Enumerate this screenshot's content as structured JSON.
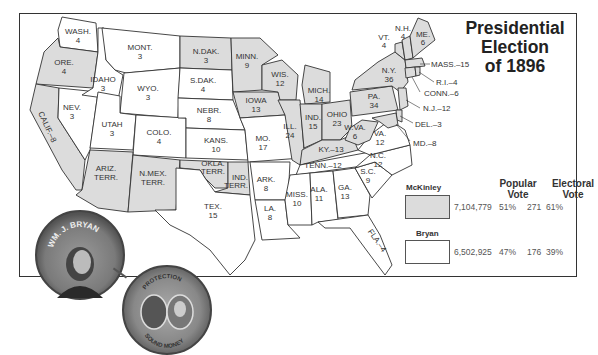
{
  "title": {
    "line1": "Presidential",
    "line2": "Election",
    "line3": "of 1896"
  },
  "colors": {
    "mckinley": "#dcdcdc",
    "bryan": "#ffffff",
    "border": "#333333"
  },
  "legend": {
    "popular_vote_header_1": "Popular",
    "popular_vote_header_2": "Vote",
    "electoral_vote_header_1": "Electoral",
    "electoral_vote_header_2": "Vote",
    "candidates": [
      {
        "name": "McKinley",
        "popular_vote": "7,104,779",
        "popular_pct": "51%",
        "electoral_vote": "271",
        "electoral_pct": "61%"
      },
      {
        "name": "Bryan",
        "popular_vote": "6,502,925",
        "popular_pct": "47%",
        "electoral_vote": "176",
        "electoral_pct": "39%"
      }
    ]
  },
  "states": {
    "wash": {
      "name": "WASH.",
      "votes": "4",
      "winner": "bryan"
    },
    "ore": {
      "name": "ORE.",
      "votes": "4",
      "winner": "mckinley"
    },
    "calif": {
      "name": "CALIF.–8",
      "winner": "mckinley"
    },
    "nev": {
      "name": "NEV.",
      "votes": "3",
      "winner": "bryan"
    },
    "idaho": {
      "name": "IDAHO",
      "votes": "3",
      "winner": "bryan"
    },
    "mont": {
      "name": "MONT.",
      "votes": "3",
      "winner": "bryan"
    },
    "wyo": {
      "name": "WYO.",
      "votes": "3",
      "winner": "bryan"
    },
    "utah": {
      "name": "UTAH",
      "votes": "3",
      "winner": "bryan"
    },
    "colo": {
      "name": "COLO.",
      "votes": "4",
      "winner": "bryan"
    },
    "ariz": {
      "name": "ARIZ.",
      "name2": "TERR.",
      "winner": "territory"
    },
    "nmex": {
      "name": "N.MEX.",
      "name2": "TERR.",
      "winner": "territory"
    },
    "ndak": {
      "name": "N.DAK.",
      "votes": "3",
      "winner": "mckinley"
    },
    "sdak": {
      "name": "S.DAK.",
      "votes": "4",
      "winner": "bryan"
    },
    "nebr": {
      "name": "NEBR.",
      "votes": "8",
      "winner": "bryan"
    },
    "kans": {
      "name": "KANS.",
      "votes": "10",
      "winner": "bryan"
    },
    "okla": {
      "name": "OKLA.",
      "name2": "TERR.",
      "winner": "territory"
    },
    "ind_terr": {
      "name": "IND.",
      "name2": "TERR.",
      "winner": "territory"
    },
    "tex": {
      "name": "TEX.",
      "votes": "15",
      "winner": "bryan"
    },
    "minn": {
      "name": "MINN.",
      "votes": "9",
      "winner": "mckinley"
    },
    "iowa": {
      "name": "IOWA",
      "votes": "13",
      "winner": "mckinley"
    },
    "mo": {
      "name": "MO.",
      "votes": "17",
      "winner": "bryan"
    },
    "ark": {
      "name": "ARK.",
      "votes": "8",
      "winner": "bryan"
    },
    "la": {
      "name": "LA.",
      "votes": "8",
      "winner": "bryan"
    },
    "wis": {
      "name": "WIS.",
      "votes": "12",
      "winner": "mckinley"
    },
    "ill": {
      "name": "ILL.",
      "votes": "24",
      "winner": "mckinley"
    },
    "mich": {
      "name": "MICH.",
      "votes": "14",
      "winner": "mckinley"
    },
    "ind": {
      "name": "IND.",
      "votes": "15",
      "winner": "mckinley"
    },
    "ohio": {
      "name": "OHIO",
      "votes": "23",
      "winner": "mckinley"
    },
    "ky": {
      "name": "KY.–13",
      "winner": "mckinley"
    },
    "tenn": {
      "name": "TENN.–12",
      "winner": "bryan"
    },
    "miss": {
      "name": "MISS.",
      "votes": "10",
      "winner": "bryan"
    },
    "ala": {
      "name": "ALA.",
      "votes": "11",
      "winner": "bryan"
    },
    "ga": {
      "name": "GA.",
      "votes": "13",
      "winner": "bryan"
    },
    "fla": {
      "name": "FLA.–4",
      "winner": "bryan"
    },
    "sc": {
      "name": "S.C.",
      "votes": "9",
      "winner": "bryan"
    },
    "nc": {
      "name": "N.C.",
      "votes": "12",
      "winner": "bryan"
    },
    "va": {
      "name": "VA.",
      "votes": "12",
      "winner": "bryan"
    },
    "wva": {
      "name": "W.VA.",
      "votes": "6",
      "winner": "mckinley"
    },
    "pa": {
      "name": "PA.",
      "votes": "34",
      "winner": "mckinley"
    },
    "ny": {
      "name": "N.Y.",
      "votes": "36",
      "winner": "mckinley"
    },
    "vt": {
      "name": "VT.",
      "votes": "4",
      "winner": "mckinley"
    },
    "nh": {
      "name": "N.H.",
      "votes": "4",
      "winner": "mckinley"
    },
    "me": {
      "name": "ME.",
      "votes": "6",
      "winner": "mckinley"
    },
    "mass": {
      "name": "MASS.–15",
      "winner": "mckinley"
    },
    "ri": {
      "name": "R.I.–4",
      "winner": "mckinley"
    },
    "conn": {
      "name": "CONN.–6",
      "winner": "mckinley"
    },
    "nj": {
      "name": "N.J.–12",
      "winner": "mckinley"
    },
    "del": {
      "name": "DEL.–3",
      "winner": "mckinley"
    },
    "md": {
      "name": "MD.–8",
      "winner": "mckinley"
    }
  },
  "buttons": {
    "bryan_button_text": "WM. J. BRYAN",
    "mckinley_button_top": "PROTECTION",
    "mckinley_button_bottom": "SOUND MONEY"
  }
}
